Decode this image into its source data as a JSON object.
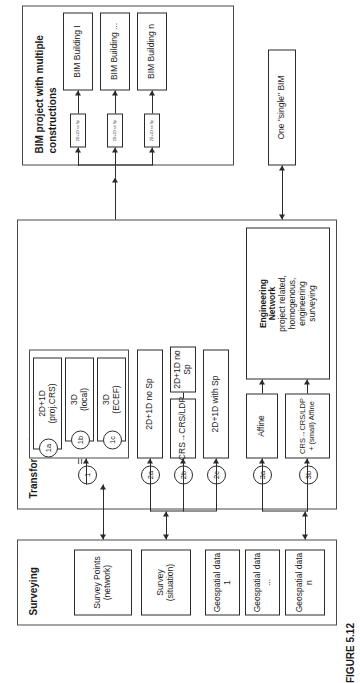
{
  "figure": {
    "caption": "FIGURE 5.12"
  },
  "bim_project": {
    "title": "BIM project with multiple constructions",
    "transfer_boxes": [
      {
        "label": "2D+1D no Sp"
      },
      {
        "label": "2D+1D no Sp"
      },
      {
        "label": "2D+1D no Sp"
      }
    ],
    "buildings": [
      {
        "label": "BIM Building  I"
      },
      {
        "label": "BIM Building ..."
      },
      {
        "label": "BIM Building n"
      }
    ]
  },
  "single_bim": {
    "label": "One \"single\" BIM"
  },
  "transformation": {
    "title": "Transformation",
    "equals_symbol": "=",
    "group1": {
      "markers": [
        "1a",
        "1b",
        "1c"
      ],
      "boxes": [
        {
          "line1": "2D+1D",
          "line2": "(proj.CRS)"
        },
        {
          "line1": "3D",
          "line2": "(local)"
        },
        {
          "line1": "3D",
          "line2": "(ECEF)"
        }
      ]
    },
    "branches": [
      {
        "marker": "1",
        "label": ""
      },
      {
        "marker": "2a",
        "label": "2D+1D no Sp"
      },
      {
        "marker": "2b",
        "label": "CRS→CRS/LDP",
        "sub_label": "2D+1D no Sp"
      },
      {
        "marker": "2c",
        "label": "2D+1D with Sp"
      },
      {
        "marker": "3a",
        "label": "Affine"
      },
      {
        "marker": "3b",
        "label": "CRS→CRS/LDP + (small) Affine"
      }
    ],
    "engineering_network": {
      "title_line1": "Engineering",
      "title_line2": "Network",
      "desc_line1": "project related,",
      "desc_line2": "homogenous,",
      "desc_line3": "engineering",
      "desc_line4": "surveying"
    }
  },
  "surveying": {
    "title": "Surveying",
    "items": [
      {
        "line1": "Survey Points",
        "line2": "(network)"
      },
      {
        "line1": "Survey",
        "line2": "(situation)"
      },
      {
        "line1": "Geospatial data 1",
        "line2": ""
      },
      {
        "line1": "Geospatial data ...",
        "line2": ""
      },
      {
        "line1": "Geospatial data n",
        "line2": ""
      }
    ]
  },
  "colors": {
    "stroke": "#2b2b2b",
    "background": "#ffffff"
  }
}
